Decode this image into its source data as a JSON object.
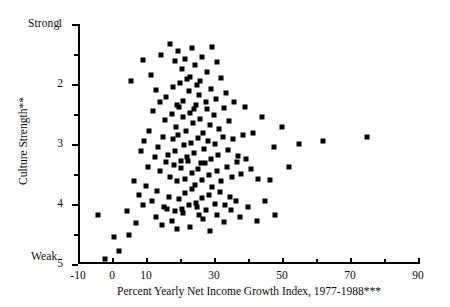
{
  "chart_data": {
    "type": "scatter",
    "title": "",
    "xlabel": "Percent Yearly Net Income Growth Index, 1977-1988***",
    "ylabel": "Culture Strength**",
    "xlim": [
      -10,
      90
    ],
    "ylim": [
      1,
      5
    ],
    "y_inverted": true,
    "grid": false,
    "legend": null,
    "axis_endpoint_labels": {
      "y_top": "Strong",
      "y_bottom": "Weak"
    },
    "xticks": [
      -10,
      0,
      10,
      20,
      30,
      40,
      50,
      60,
      70,
      80,
      90
    ],
    "xtick_labels": [
      "-10",
      "0",
      "10",
      "",
      "30",
      "",
      "50",
      "",
      "70",
      "",
      "90"
    ],
    "yticks": [
      1,
      1.5,
      2,
      2.5,
      3,
      3.5,
      4,
      4.5,
      5
    ],
    "ytick_labels": [
      "1",
      "",
      "2",
      "",
      "3",
      "",
      "4",
      "",
      "5"
    ],
    "marker": "square",
    "marker_color": "#000000",
    "n_points": 160,
    "points": [
      [
        5.5,
        1.95
      ],
      [
        9.0,
        1.6
      ],
      [
        11.5,
        1.85
      ],
      [
        13.0,
        2.1
      ],
      [
        14.5,
        1.52
      ],
      [
        17.0,
        1.33
      ],
      [
        18.5,
        1.62
      ],
      [
        19.5,
        1.45
      ],
      [
        20.5,
        1.75
      ],
      [
        21.5,
        1.58
      ],
      [
        22.0,
        1.92
      ],
      [
        23.5,
        1.4
      ],
      [
        24.5,
        1.68
      ],
      [
        25.0,
        2.02
      ],
      [
        26.5,
        1.55
      ],
      [
        28.0,
        1.8
      ],
      [
        29.5,
        1.38
      ],
      [
        31.0,
        1.63
      ],
      [
        16.0,
        2.22
      ],
      [
        18.0,
        2.05
      ],
      [
        19.0,
        2.35
      ],
      [
        20.0,
        1.98
      ],
      [
        21.0,
        2.28
      ],
      [
        22.5,
        2.12
      ],
      [
        23.0,
        1.88
      ],
      [
        24.0,
        2.42
      ],
      [
        25.5,
        2.18
      ],
      [
        26.0,
        1.95
      ],
      [
        27.5,
        2.3
      ],
      [
        29.0,
        2.08
      ],
      [
        30.5,
        2.25
      ],
      [
        32.0,
        1.9
      ],
      [
        33.5,
        2.15
      ],
      [
        12.0,
        2.45
      ],
      [
        14.0,
        2.3
      ],
      [
        15.5,
        2.6
      ],
      [
        17.5,
        2.5
      ],
      [
        18.8,
        2.72
      ],
      [
        19.8,
        2.38
      ],
      [
        20.8,
        2.55
      ],
      [
        21.8,
        2.78
      ],
      [
        22.8,
        2.48
      ],
      [
        23.8,
        2.65
      ],
      [
        24.8,
        2.35
      ],
      [
        25.8,
        2.58
      ],
      [
        26.8,
        2.82
      ],
      [
        27.8,
        2.42
      ],
      [
        28.8,
        2.68
      ],
      [
        30.0,
        2.52
      ],
      [
        31.5,
        2.75
      ],
      [
        33.0,
        2.4
      ],
      [
        34.5,
        2.62
      ],
      [
        36.0,
        2.3
      ],
      [
        9.5,
        2.95
      ],
      [
        11.0,
        2.78
      ],
      [
        13.5,
        3.05
      ],
      [
        15.0,
        2.88
      ],
      [
        16.5,
        3.18
      ],
      [
        17.8,
        2.92
      ],
      [
        18.6,
        3.12
      ],
      [
        19.4,
        2.85
      ],
      [
        20.2,
        3.28
      ],
      [
        21.2,
        3.02
      ],
      [
        22.2,
        3.22
      ],
      [
        23.2,
        2.98
      ],
      [
        24.2,
        3.15
      ],
      [
        25.2,
        2.9
      ],
      [
        26.2,
        3.32
      ],
      [
        27.2,
        3.08
      ],
      [
        28.2,
        2.95
      ],
      [
        29.2,
        3.25
      ],
      [
        30.2,
        3.0
      ],
      [
        31.2,
        3.18
      ],
      [
        32.5,
        2.88
      ],
      [
        34.0,
        3.1
      ],
      [
        35.5,
        2.92
      ],
      [
        37.0,
        3.2
      ],
      [
        38.5,
        2.85
      ],
      [
        8.5,
        3.12
      ],
      [
        10.5,
        3.38
      ],
      [
        12.5,
        3.22
      ],
      [
        14.2,
        3.45
      ],
      [
        15.8,
        3.3
      ],
      [
        17.2,
        3.55
      ],
      [
        18.2,
        3.35
      ],
      [
        19.2,
        3.62
      ],
      [
        20.4,
        3.4
      ],
      [
        21.4,
        3.58
      ],
      [
        22.4,
        3.28
      ],
      [
        23.4,
        3.48
      ],
      [
        24.4,
        3.68
      ],
      [
        25.4,
        3.42
      ],
      [
        26.4,
        3.6
      ],
      [
        27.4,
        3.32
      ],
      [
        28.4,
        3.52
      ],
      [
        29.4,
        3.72
      ],
      [
        30.8,
        3.45
      ],
      [
        32.2,
        3.62
      ],
      [
        33.8,
        3.38
      ],
      [
        35.2,
        3.55
      ],
      [
        36.8,
        3.3
      ],
      [
        38.0,
        3.5
      ],
      [
        39.5,
        3.25
      ],
      [
        41.0,
        3.42
      ],
      [
        43.0,
        3.58
      ],
      [
        6.5,
        3.62
      ],
      [
        8.0,
        3.85
      ],
      [
        10.0,
        3.7
      ],
      [
        11.8,
        3.95
      ],
      [
        13.2,
        3.78
      ],
      [
        15.2,
        4.05
      ],
      [
        16.8,
        3.88
      ],
      [
        18.4,
        4.12
      ],
      [
        19.6,
        3.92
      ],
      [
        20.6,
        4.08
      ],
      [
        21.6,
        3.82
      ],
      [
        22.6,
        4.02
      ],
      [
        23.6,
        3.75
      ],
      [
        24.6,
        3.98
      ],
      [
        25.6,
        4.18
      ],
      [
        26.6,
        3.9
      ],
      [
        27.6,
        4.1
      ],
      [
        28.6,
        3.85
      ],
      [
        30.4,
        4.0
      ],
      [
        31.8,
        3.8
      ],
      [
        33.2,
        4.02
      ],
      [
        34.8,
        3.88
      ],
      [
        36.4,
        3.95
      ],
      [
        4.5,
        4.12
      ],
      [
        7.0,
        4.32
      ],
      [
        9.2,
        4.02
      ],
      [
        12.8,
        4.22
      ],
      [
        14.8,
        4.35
      ],
      [
        16.2,
        4.08
      ],
      [
        17.6,
        4.28
      ],
      [
        19.0,
        4.42
      ],
      [
        20.9,
        4.15
      ],
      [
        22.9,
        4.38
      ],
      [
        24.9,
        4.05
      ],
      [
        26.9,
        4.25
      ],
      [
        28.9,
        4.45
      ],
      [
        31.0,
        4.18
      ],
      [
        33.0,
        4.3
      ],
      [
        35.0,
        4.1
      ],
      [
        37.5,
        4.22
      ],
      [
        40.0,
        4.05
      ],
      [
        42.5,
        4.28
      ],
      [
        45.0,
        3.95
      ],
      [
        46.5,
        3.6
      ],
      [
        48.0,
        4.18
      ],
      [
        2.0,
        4.78
      ],
      [
        -2.0,
        4.92
      ],
      [
        -4.0,
        4.18
      ],
      [
        0.5,
        4.55
      ],
      [
        5.0,
        4.52
      ],
      [
        39.0,
        2.38
      ],
      [
        41.5,
        2.82
      ],
      [
        44.0,
        2.55
      ],
      [
        47.5,
        3.05
      ],
      [
        50.0,
        2.72
      ],
      [
        52.0,
        3.38
      ],
      [
        55.0,
        3.0
      ],
      [
        62.0,
        2.95
      ],
      [
        75.0,
        2.88
      ]
    ]
  }
}
